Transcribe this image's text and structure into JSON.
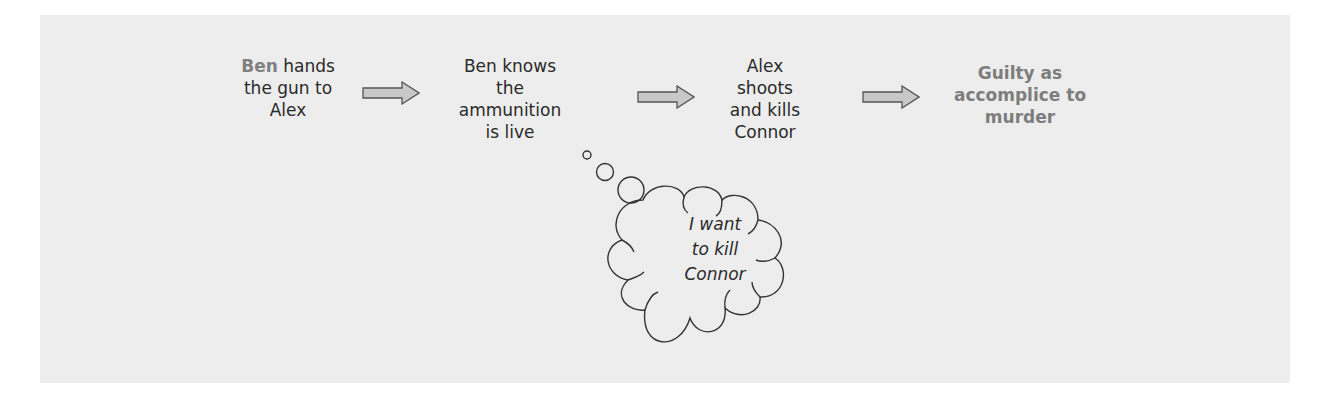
{
  "diagram": {
    "type": "flow",
    "steps": [
      {
        "id": "step-1",
        "lines": [
          "hands",
          "the gun to",
          "Alex"
        ],
        "highlight_prefix": "Ben"
      },
      {
        "id": "step-2",
        "lines": [
          "Ben knows",
          "the",
          "ammunition",
          "is live"
        ]
      },
      {
        "id": "step-3",
        "lines": [
          "Alex",
          "shoots",
          "and kills",
          "Connor"
        ]
      },
      {
        "id": "outcome",
        "lines": [
          "Guilty as",
          "accomplice to",
          "murder"
        ]
      }
    ],
    "arrows": [
      {
        "from": "step-1",
        "to": "step-2"
      },
      {
        "from": "step-2",
        "to": "step-3"
      },
      {
        "from": "step-3",
        "to": "outcome"
      }
    ],
    "thought_bubble": {
      "attached_to": "step-2",
      "lines": [
        "I want",
        "to kill",
        "Connor"
      ]
    },
    "colors": {
      "panel_background": "#ededed",
      "text": "#2a2a2a",
      "highlight_text": "#808080",
      "arrow_fill": "#c8c8c8",
      "arrow_stroke": "#555555",
      "cloud_stroke": "#333333"
    }
  }
}
